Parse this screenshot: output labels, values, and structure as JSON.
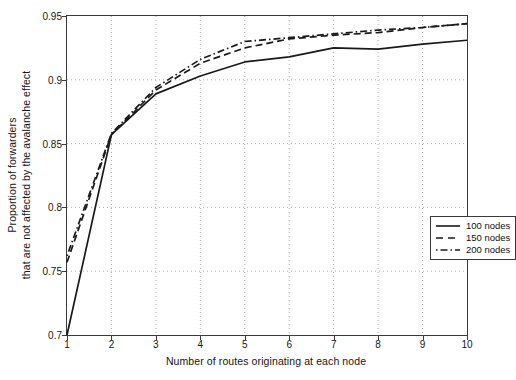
{
  "chart_data": {
    "type": "line",
    "title": "",
    "xlabel": "Number of routes originating at each node",
    "ylabel": "Proportion of forwarders\nthat are not affected by the avalanche effect",
    "ylabel_line1": "Proportion of forwarders",
    "ylabel_line2": "that are not affected by the avalanche effect",
    "xlim": [
      1,
      10
    ],
    "ylim": [
      0.7,
      0.95
    ],
    "grid": true,
    "grid_style": "dotted",
    "legend_position": "lower right",
    "xticks": [
      1,
      2,
      3,
      4,
      5,
      6,
      7,
      8,
      9,
      10
    ],
    "xtick_labels": [
      "1",
      "2",
      "3",
      "4",
      "5",
      "6",
      "7",
      "8",
      "9",
      "10"
    ],
    "yticks": [
      0.7,
      0.75,
      0.8,
      0.85,
      0.9,
      0.95
    ],
    "ytick_labels": [
      "0.7",
      "0.75",
      "0.8",
      "0.85",
      "0.9",
      "0.95"
    ],
    "x": [
      1,
      2,
      3,
      4,
      5,
      6,
      7,
      8,
      9,
      10
    ],
    "series": [
      {
        "name": "100 nodes",
        "label": "100 nodes",
        "linestyle": "solid",
        "color": "#1a1a1a",
        "values": [
          0.7,
          0.857,
          0.889,
          0.903,
          0.914,
          0.918,
          0.925,
          0.924,
          0.928,
          0.931
        ]
      },
      {
        "name": "150 nodes",
        "label": "150 nodes",
        "linestyle": "dashed",
        "color": "#1a1a1a",
        "values": [
          0.757,
          0.857,
          0.892,
          0.913,
          0.925,
          0.932,
          0.935,
          0.937,
          0.941,
          0.944
        ]
      },
      {
        "name": "200 nodes",
        "label": "200 nodes",
        "linestyle": "dashdot",
        "color": "#1a1a1a",
        "values": [
          0.762,
          0.858,
          0.894,
          0.916,
          0.93,
          0.933,
          0.936,
          0.939,
          0.941,
          0.944
        ]
      }
    ]
  },
  "legend": {
    "items": [
      {
        "label": "100 nodes",
        "style": "solid"
      },
      {
        "label": "150 nodes",
        "style": "dashed"
      },
      {
        "label": "200 nodes",
        "style": "dashdot"
      }
    ]
  },
  "axes": {
    "x_title": "Number of routes originating at each node",
    "y_title_line1": "Proportion of forwarders",
    "y_title_line2": "that are not affected by the avalanche effect"
  }
}
